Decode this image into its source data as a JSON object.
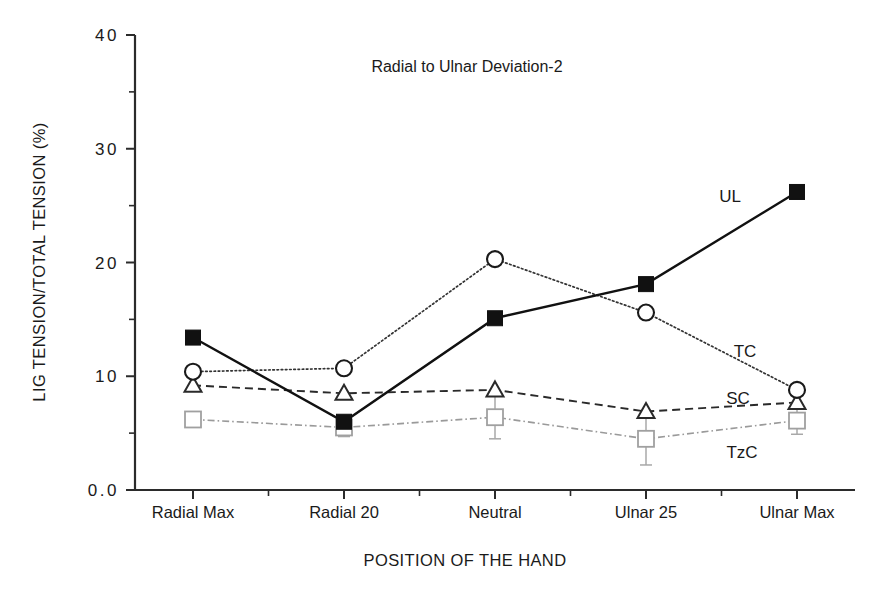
{
  "chart_data": {
    "type": "line",
    "title": "Radial to Ulnar Deviation-2",
    "xlabel": "POSITION OF THE HAND",
    "ylabel": "LIG TENSION/TOTAL TENSION (%)",
    "categories": [
      "Radial Max",
      "Radial 20",
      "Neutral",
      "Ulnar 25",
      "Ulnar Max"
    ],
    "ylim": [
      0.0,
      40
    ],
    "ytick_labels": [
      "0.0",
      "10",
      "20",
      "30",
      "40"
    ],
    "ytick_values": [
      0,
      10,
      20,
      30,
      40
    ],
    "yminor_values": [
      5,
      15,
      25,
      35
    ],
    "grid": false,
    "legend_position": "inline-right-of-series",
    "series": [
      {
        "name": "UL",
        "marker": "filled-square",
        "line_style": "solid",
        "color": "#111111",
        "values": [
          13.4,
          6.0,
          15.1,
          18.1,
          26.2
        ],
        "errors": [
          0,
          0,
          0,
          0,
          0
        ]
      },
      {
        "name": "TC",
        "marker": "open-circle",
        "line_style": "dotted",
        "color": "#333333",
        "values": [
          10.4,
          10.7,
          20.3,
          15.6,
          8.8
        ],
        "errors": [
          0,
          0,
          0,
          0,
          0
        ]
      },
      {
        "name": "SC",
        "marker": "open-triangle",
        "line_style": "dashed",
        "color": "#2a2a2a",
        "values": [
          9.2,
          8.5,
          8.8,
          6.9,
          7.7
        ],
        "errors": [
          0,
          0,
          0,
          0,
          0
        ]
      },
      {
        "name": "TzC",
        "marker": "open-square",
        "line_style": "dash-dot",
        "color": "#9a9a9a",
        "values": [
          6.2,
          5.5,
          6.4,
          4.5,
          6.1
        ],
        "errors": [
          0.5,
          0.8,
          1.9,
          2.3,
          1.2
        ]
      }
    ],
    "annotations": [
      {
        "text": "UL",
        "x_px": 730,
        "y_px": 202
      },
      {
        "text": "TC",
        "x_px": 745,
        "y_px": 357
      },
      {
        "text": "SC",
        "x_px": 738,
        "y_px": 404
      },
      {
        "text": "TzC",
        "x_px": 742,
        "y_px": 458
      }
    ]
  }
}
